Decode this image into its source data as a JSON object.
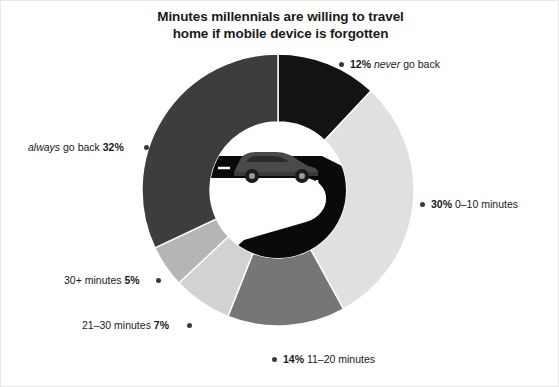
{
  "title": {
    "line1": "Minutes millennials are willing to travel",
    "line2": "home if mobile device is forgotten"
  },
  "center_art": {
    "name": "car-on-winding-road-illustration",
    "road_color": "#0a0a0a",
    "lane_marking_color": "#ffffff",
    "car_color": "#4a4a4a"
  },
  "labels": {
    "never": {
      "pct": "12%",
      "emphasis": "never",
      "rest": "go back"
    },
    "zero_ten": {
      "pct": "30%",
      "rest": "0–10 minutes"
    },
    "eleven_twenty": {
      "pct": "14%",
      "rest": "11–20 minutes"
    },
    "twentyone_thirty": {
      "pct": "7%",
      "rest": "21–30 minutes"
    },
    "thirty_plus": {
      "pct": "5%",
      "rest": "30+ minutes"
    },
    "always": {
      "pct": "32%",
      "emphasis": "always",
      "rest": "go back"
    }
  },
  "chart_data": {
    "type": "pie",
    "title": "Minutes millennials are willing to travel home if mobile device is forgotten",
    "subtitle": "",
    "xlabel": "",
    "ylabel": "",
    "donut": true,
    "inner_radius_ratio": 0.5,
    "start_angle_deg": 0,
    "direction": "clockwise",
    "units": "percent",
    "total": 100,
    "legend_position": "around-slices",
    "grid": false,
    "categories": [
      "never go back",
      "0–10 minutes",
      "11–20 minutes",
      "21–30 minutes",
      "30+ minutes",
      "always go back"
    ],
    "values": [
      12,
      30,
      14,
      7,
      5,
      32
    ],
    "colors": [
      "#131313",
      "#e0e0e0",
      "#767676",
      "#d2d2d2",
      "#b5b5b5",
      "#3d3d3d"
    ],
    "slices": [
      {
        "label": "never go back",
        "value": 12,
        "display": "12%",
        "color": "#131313"
      },
      {
        "label": "0–10 minutes",
        "value": 30,
        "display": "30%",
        "color": "#e0e0e0"
      },
      {
        "label": "11–20 minutes",
        "value": 14,
        "display": "14%",
        "color": "#767676"
      },
      {
        "label": "21–30 minutes",
        "value": 7,
        "display": "7%",
        "color": "#d2d2d2"
      },
      {
        "label": "30+ minutes",
        "value": 5,
        "display": "5%",
        "color": "#b5b5b5"
      },
      {
        "label": "always go back",
        "value": 32,
        "display": "32%",
        "color": "#3d3d3d"
      }
    ]
  }
}
